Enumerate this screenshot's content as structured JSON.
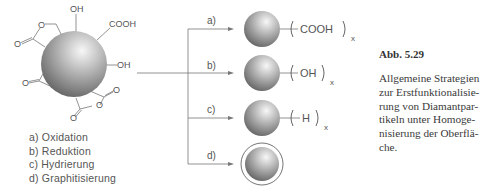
{
  "figure": {
    "label": "Abb. 5.29",
    "caption_lines": [
      "Allgemeine Strategien",
      "zur Erstfunktionalisie-",
      "rung von Diamantpar-",
      "tikeln unter Homoge-",
      "nisierung der Oberflä-",
      "che."
    ]
  },
  "start_particle": {
    "groups": [
      "OH",
      "COOH",
      "OH",
      "O",
      "O",
      "O",
      "O",
      "O",
      "O",
      "O"
    ]
  },
  "legend": [
    "a) Oxidation",
    "b) Reduktion",
    "c) Hydrierung",
    "d) Graphitisierung"
  ],
  "branches": [
    {
      "label": "a)",
      "group": "COOH",
      "subscript": "x"
    },
    {
      "label": "b)",
      "group": "OH",
      "subscript": "x"
    },
    {
      "label": "c)",
      "group": "H",
      "subscript": "x"
    },
    {
      "label": "d)",
      "group": "",
      "subscript": ""
    }
  ],
  "colors": {
    "line": "#777777",
    "text": "#555555",
    "sphere_light": "#f4f4f4",
    "sphere_dark": "#6a6a6a"
  }
}
